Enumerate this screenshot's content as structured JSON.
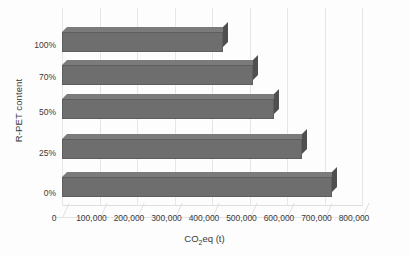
{
  "chart_data": {
    "type": "bar",
    "orientation": "horizontal",
    "style": "3d",
    "title": "",
    "subtitle": "",
    "xlabel": "CO2eq (t)",
    "xlabel_rich": {
      "prefix": "CO",
      "sub": "2",
      "suffix": "eq (t)"
    },
    "ylabel": "R-PET content",
    "categories": [
      "0%",
      "25%",
      "50%",
      "70%",
      "100%"
    ],
    "categories_top_to_bottom": [
      "100%",
      "70%",
      "50%",
      "25%",
      "0%"
    ],
    "values": [
      720000,
      640000,
      565000,
      510000,
      430000
    ],
    "series": [
      {
        "name": "CO2eq (t)",
        "color": "#6e6e6e",
        "points": [
          {
            "category": "0%",
            "value": 720000
          },
          {
            "category": "25%",
            "value": 640000
          },
          {
            "category": "50%",
            "value": 565000
          },
          {
            "category": "70%",
            "value": 510000
          },
          {
            "category": "100%",
            "value": 430000
          }
        ]
      }
    ],
    "xlim": [
      0,
      800000
    ],
    "xticks": [
      0,
      100000,
      200000,
      300000,
      400000,
      500000,
      600000,
      700000,
      800000
    ],
    "xtick_labels": [
      "0",
      "100,000",
      "200,000",
      "300,000",
      "400,000",
      "500,000",
      "600,000",
      "700,000",
      "800,000"
    ],
    "grid": true,
    "grid_axis": "x",
    "legend": false,
    "legend_position": "none",
    "background_color": "#ffffff",
    "bar_color": "#6e6e6e",
    "bar_top_color": "#7b7b7b",
    "bar_side_color": "#4f4f4f",
    "gridline_color": "#e6e6e6",
    "text_color": "#3a3a3a"
  }
}
